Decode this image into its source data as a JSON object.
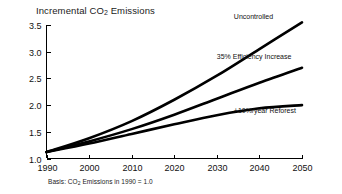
{
  "chart_data": {
    "type": "line",
    "title": "Incremental CO2 Emissions",
    "title_prefix": "Incremental CO",
    "title_sub": "2",
    "title_suffix": " Emissions",
    "xlabel": "",
    "ylabel": "",
    "footnote": "Basis: CO2 Emissions in 1990 = 1.0",
    "footnote_prefix": "Basis: CO",
    "footnote_sub": "2",
    "footnote_suffix": " Emissions in 1990 = 1.0",
    "grid": false,
    "legend_position": "inline-right",
    "xlim": [
      1990,
      2050
    ],
    "ylim": [
      1.0,
      3.5
    ],
    "x": [
      1990,
      2000,
      2010,
      2020,
      2030,
      2040,
      2050
    ],
    "xticks": [
      "1990",
      "2000",
      "2010",
      "2020",
      "2030",
      "2040",
      "2050"
    ],
    "yticks": [
      "1.0",
      "1.5",
      "2.0",
      "2.5",
      "3.0",
      "3.5"
    ],
    "ytick_values": [
      1.0,
      1.5,
      2.0,
      2.5,
      3.0,
      3.5
    ],
    "line_color": "#000000",
    "series": [
      {
        "name": "Uncontrolled",
        "label": "Uncontrolled",
        "values": [
          1.12,
          1.38,
          1.7,
          2.1,
          2.55,
          3.05,
          3.55
        ]
      },
      {
        "name": "35% Efficiency Increase",
        "label": "35% Efficiency Increase",
        "values": [
          1.12,
          1.32,
          1.55,
          1.82,
          2.12,
          2.42,
          2.7
        ]
      },
      {
        "name": "+10%/year Reforest",
        "label": "+10%/year Reforest",
        "values": [
          1.12,
          1.28,
          1.46,
          1.64,
          1.81,
          1.94,
          2.0
        ]
      }
    ]
  }
}
